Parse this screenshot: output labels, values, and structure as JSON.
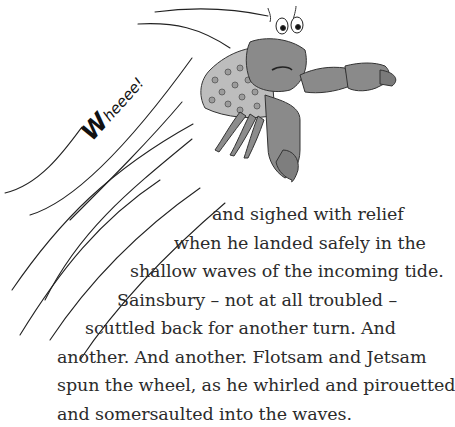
{
  "page": {
    "illustration": {
      "subject": "hermit crab in a thimble shell flying through the air",
      "exclamation": "Wheeee!",
      "colors": {
        "crab": "#8a8a8a",
        "crab_dark": "#6a6a6a",
        "shell": "#b8b8b8",
        "ink": "#222222"
      }
    },
    "text_lines": [
      "and sighed with relief",
      "when he landed safely in the",
      "shallow waves of the incoming tide.",
      "Sainsbury – not at all troubled –",
      "scuttled back for another turn. And",
      "another. And another. Flotsam and Jetsam",
      "spun the wheel, as he whirled and pirouetted",
      "and somersaulted into the waves."
    ]
  }
}
